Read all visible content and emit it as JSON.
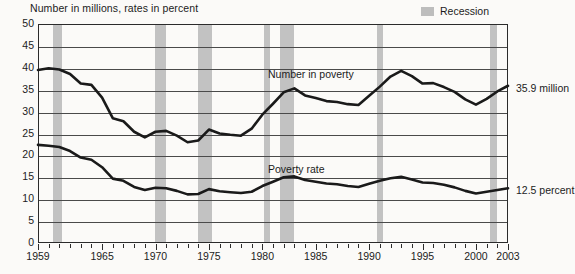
{
  "header": {
    "axis_note": "Number in millions, rates in percent",
    "legend_label": "Recession",
    "legend_swatch_color": "#c2c2c2"
  },
  "annotations": {
    "number_in_poverty_label": "Number in poverty",
    "poverty_rate_label": "Poverty rate",
    "end_label_number": "35.9 million",
    "end_label_rate": "12.5 percent"
  },
  "chart_data": {
    "type": "line",
    "title": "",
    "subtitle": "",
    "xlabel": "",
    "ylabel": "Number in millions, rates in percent",
    "xlim": [
      1959,
      2003
    ],
    "ylim": [
      0,
      50
    ],
    "grid": true,
    "legend_position": "top-right",
    "yticks": [
      0,
      5,
      10,
      15,
      20,
      25,
      30,
      35,
      40,
      45,
      50
    ],
    "xticks": [
      1959,
      1965,
      1970,
      1975,
      1980,
      1985,
      1990,
      1995,
      2000,
      2003
    ],
    "x": [
      1959,
      1960,
      1961,
      1962,
      1963,
      1964,
      1965,
      1966,
      1967,
      1968,
      1969,
      1970,
      1971,
      1972,
      1973,
      1974,
      1975,
      1976,
      1977,
      1978,
      1979,
      1980,
      1981,
      1982,
      1983,
      1984,
      1985,
      1986,
      1987,
      1988,
      1989,
      1990,
      1991,
      1992,
      1993,
      1994,
      1995,
      1996,
      1997,
      1998,
      1999,
      2000,
      2001,
      2002,
      2003
    ],
    "series": [
      {
        "name": "Number in poverty",
        "units": "millions",
        "color": "#1a1a1a",
        "values": [
          39.5,
          39.9,
          39.6,
          38.6,
          36.4,
          36.1,
          33.2,
          28.5,
          27.8,
          25.4,
          24.1,
          25.4,
          25.6,
          24.5,
          23.0,
          23.4,
          25.9,
          25.0,
          24.7,
          24.5,
          26.1,
          29.3,
          31.8,
          34.4,
          35.3,
          33.7,
          33.1,
          32.4,
          32.2,
          31.7,
          31.5,
          33.6,
          35.7,
          38.0,
          39.3,
          38.1,
          36.4,
          36.5,
          35.6,
          34.5,
          32.8,
          31.6,
          32.9,
          34.6,
          35.9
        ]
      },
      {
        "name": "Poverty rate",
        "units": "percent",
        "color": "#1a1a1a",
        "values": [
          22.4,
          22.2,
          21.9,
          21.0,
          19.5,
          19.0,
          17.3,
          14.7,
          14.2,
          12.8,
          12.1,
          12.6,
          12.5,
          11.9,
          11.1,
          11.2,
          12.3,
          11.8,
          11.6,
          11.4,
          11.7,
          13.0,
          14.0,
          15.0,
          15.2,
          14.4,
          14.0,
          13.6,
          13.4,
          13.0,
          12.8,
          13.5,
          14.2,
          14.8,
          15.1,
          14.5,
          13.8,
          13.7,
          13.3,
          12.7,
          11.9,
          11.3,
          11.7,
          12.1,
          12.5
        ]
      }
    ],
    "recessions": [
      {
        "start": 1960.3,
        "end": 1961.2
      },
      {
        "start": 1969.9,
        "end": 1970.9
      },
      {
        "start": 1973.9,
        "end": 1975.2
      },
      {
        "start": 1980.1,
        "end": 1980.6
      },
      {
        "start": 1981.6,
        "end": 1982.9
      },
      {
        "start": 1990.6,
        "end": 1991.2
      },
      {
        "start": 2001.2,
        "end": 2001.9
      }
    ]
  }
}
